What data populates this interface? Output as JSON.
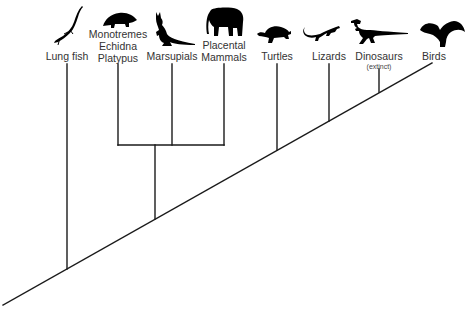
{
  "diagram": {
    "type": "cladogram",
    "line_color": "#1a1a1a",
    "icon_color": "#000000",
    "taxa": [
      {
        "id": "lung-fish",
        "label_lines": [
          "Lung fish"
        ],
        "icon": "lungfish-icon",
        "x": 67
      },
      {
        "id": "monotremes",
        "label_lines": [
          "Monotremes",
          "Echidna",
          "Platypus"
        ],
        "icon": "echidna-icon",
        "x": 118
      },
      {
        "id": "marsupials",
        "label_lines": [
          "Marsupials"
        ],
        "icon": "kangaroo-icon",
        "x": 172
      },
      {
        "id": "placental-mammals",
        "label_lines": [
          "Placental",
          "Mammals"
        ],
        "icon": "elephant-icon",
        "x": 224
      },
      {
        "id": "turtles",
        "label_lines": [
          "Turtles"
        ],
        "icon": "turtle-icon",
        "x": 277
      },
      {
        "id": "lizards",
        "label_lines": [
          "Lizards"
        ],
        "icon": "lizard-icon",
        "x": 329
      },
      {
        "id": "dinosaurs",
        "label_lines": [
          "Dinosaurs"
        ],
        "note": "(extinct)",
        "icon": "dinosaur-icon",
        "x": 379
      },
      {
        "id": "birds",
        "label_lines": [
          "Birds"
        ],
        "icon": "bird-icon",
        "x": 432
      }
    ],
    "labels": {
      "lung_fish": "Lung fish",
      "monotremes_1": "Monotremes",
      "monotremes_2": "Echidna",
      "monotremes_3": "Platypus",
      "marsupials": "Marsupials",
      "placental_1": "Placental",
      "placental_2": "Mammals",
      "turtles": "Turtles",
      "lizards": "Lizards",
      "dinosaurs": "Dinosaurs",
      "dinosaurs_note": "(extinct)",
      "birds": "Birds"
    },
    "structure": "(Lung fish, ((Monotremes, Marsupials, Placental Mammals), (Turtles, (Lizards, (Dinosaurs, Birds)))))"
  }
}
